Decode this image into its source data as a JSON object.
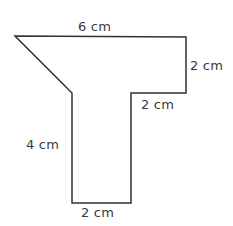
{
  "figure": {
    "type": "geometry-composite-polygon",
    "background_color": "#ffffff",
    "stroke_color": "#333333",
    "stroke_width": 1.5,
    "fill_color": "none",
    "label_color": "#3a3a3a",
    "unit": "cm"
  },
  "polygon": {
    "points": "15,36 186,37 186,93 131,93 131,203 72,203 72,93",
    "vertices": [
      {
        "name": "top-left-apex",
        "x": 15,
        "y": 36
      },
      {
        "name": "top-right-corner",
        "x": 186,
        "y": 37
      },
      {
        "name": "right-arm-bottom",
        "x": 186,
        "y": 93
      },
      {
        "name": "inner-right-corner",
        "x": 131,
        "y": 93
      },
      {
        "name": "stem-bottom-right",
        "x": 131,
        "y": 203
      },
      {
        "name": "stem-bottom-left",
        "x": 72,
        "y": 203
      },
      {
        "name": "stem-top-left",
        "x": 72,
        "y": 93
      }
    ]
  },
  "labels": {
    "top": "6 cm",
    "right": "2 cm",
    "middle": "2 cm",
    "left": "4 cm",
    "bottom": "2 cm"
  }
}
